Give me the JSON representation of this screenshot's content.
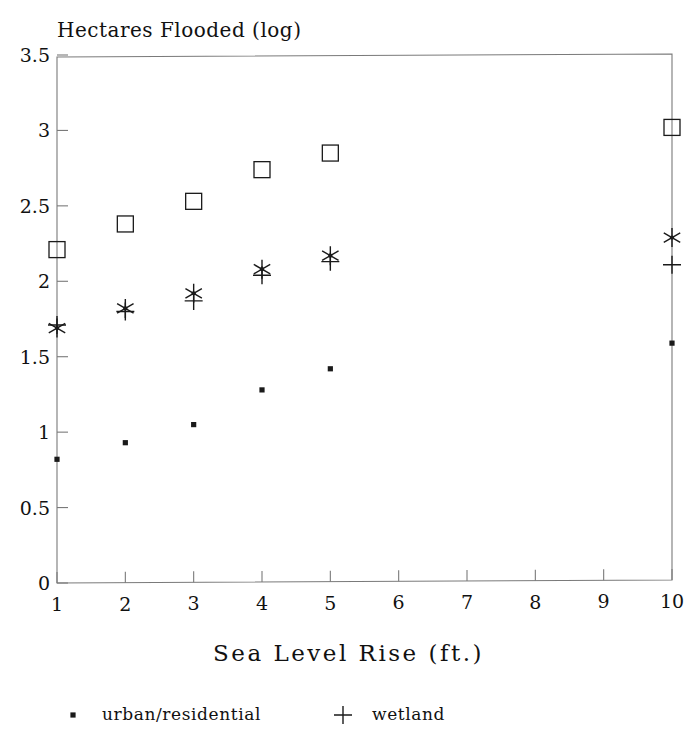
{
  "chart_data": {
    "type": "scatter",
    "title": "Hectares Flooded (log)",
    "xlabel": "Sea Level Rise (ft.)",
    "ylabel": "Hectares Flooded (log)",
    "x": [
      1,
      2,
      3,
      4,
      5,
      10
    ],
    "xlim": [
      1,
      10
    ],
    "ylim": [
      0,
      3.5
    ],
    "xticks": [
      "1",
      "2",
      "3",
      "4",
      "5",
      "6",
      "7",
      "8",
      "9",
      "10"
    ],
    "xtick_values": [
      1,
      2,
      3,
      4,
      5,
      6,
      7,
      8,
      9,
      10
    ],
    "yticks": [
      "0",
      "0.5",
      "1",
      "1.5",
      "2",
      "2.5",
      "3",
      "3.5"
    ],
    "ytick_values": [
      0,
      0.5,
      1,
      1.5,
      2,
      2.5,
      3,
      3.5
    ],
    "grid": false,
    "legend_position": "bottom",
    "series": [
      {
        "name": "urban/residential",
        "marker": "dot",
        "color": "#1a1a1a",
        "values": [
          0.82,
          0.93,
          1.05,
          1.28,
          1.42,
          1.59
        ]
      },
      {
        "name": "wetland",
        "marker": "plus",
        "color": "#1a1a1a",
        "values": [
          1.71,
          1.8,
          1.87,
          2.04,
          2.13,
          2.11
        ]
      },
      {
        "name": "series-asterisk",
        "marker": "asterisk",
        "color": "#1a1a1a",
        "values": [
          1.69,
          1.82,
          1.92,
          2.08,
          2.17,
          2.29
        ]
      },
      {
        "name": "series-square",
        "marker": "square",
        "color": "#1a1a1a",
        "values": [
          2.21,
          2.38,
          2.53,
          2.74,
          2.85,
          3.02
        ]
      }
    ]
  },
  "legend": {
    "entries": [
      {
        "label": "urban/residential",
        "marker": "dot"
      },
      {
        "label": "wetland",
        "marker": "plus"
      }
    ]
  },
  "colors": {
    "ink": "#1a1a1a",
    "axis": "#7a7a7a",
    "background": "#ffffff"
  }
}
